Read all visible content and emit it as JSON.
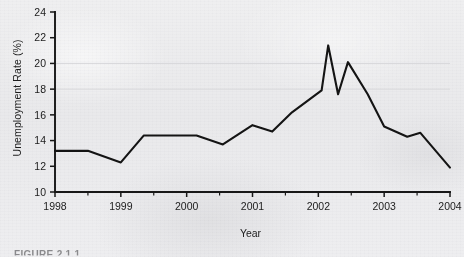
{
  "figure": {
    "caption": "FIGURE 2.1.1",
    "background_color": "#ececed",
    "line_color": "#141414"
  },
  "chart_data": {
    "type": "line",
    "title": "",
    "xlabel": "Year",
    "ylabel": "Unemployment Rate (%)",
    "xlim": [
      1998,
      2004
    ],
    "ylim": [
      10,
      24
    ],
    "grid": false,
    "legend": false,
    "x_tick_labels": [
      "1998",
      "1999",
      "2000",
      "2001",
      "2002",
      "2003",
      "2004"
    ],
    "x_ticks": [
      1998,
      1999,
      2000,
      2001,
      2002,
      2003,
      2004
    ],
    "y_tick_labels": [
      "10",
      "12",
      "14",
      "16",
      "18",
      "20",
      "22",
      "24"
    ],
    "y_ticks": [
      10,
      12,
      14,
      16,
      18,
      20,
      22,
      24
    ],
    "minor_x_ticks": [
      1998.5,
      1999.5,
      2000.5,
      2001.5,
      2002.5,
      2003.5
    ],
    "series": [
      {
        "name": "Unemployment Rate",
        "x": [
          1998.0,
          1998.25,
          1998.5,
          1999.0,
          1999.35,
          1999.8,
          2000.15,
          2000.55,
          2001.0,
          2001.3,
          2001.6,
          2002.05,
          2002.15,
          2002.3,
          2002.45,
          2002.75,
          2003.0,
          2003.35,
          2003.55,
          2004.0
        ],
        "y": [
          13.2,
          13.2,
          13.2,
          12.3,
          14.4,
          14.4,
          14.4,
          13.7,
          15.2,
          14.7,
          16.2,
          17.9,
          21.4,
          17.6,
          20.1,
          17.6,
          15.1,
          14.3,
          14.6,
          11.9
        ]
      }
    ]
  }
}
